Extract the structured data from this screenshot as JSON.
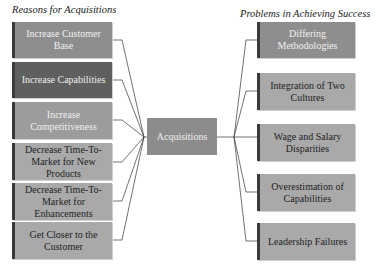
{
  "left_heading": "Reasons for Acquisitions",
  "right_heading": "Problems in Achieving Success",
  "center": {
    "label": "Acquisitions",
    "color": "#8c8c8c"
  },
  "reasons": [
    {
      "label": "Increase Customer Base",
      "color": "#8e8e8e"
    },
    {
      "label": "Increase Capabilities",
      "color": "#5f5f5f"
    },
    {
      "label": "Increase Competitiveness",
      "color": "#9c9c9c"
    },
    {
      "label": "Decrease Time-To-Market for New Products",
      "color": "#a9a9a9"
    },
    {
      "label": "Decrease Time-To-Market for Enhancements",
      "color": "#a9a9a9"
    },
    {
      "label": "Get Closer to the Customer",
      "color": "#a9a9a9"
    }
  ],
  "problems": [
    {
      "label": "Differing Methodologies",
      "color": "#8e8e8e"
    },
    {
      "label": "Integration of Two Cultures",
      "color": "#a9a9a9"
    },
    {
      "label": "Wage and Salary Disparities",
      "color": "#a9a9a9"
    },
    {
      "label": "Overestimation of Capabilities",
      "color": "#a9a9a9"
    },
    {
      "label": "Leadership Failures",
      "color": "#a9a9a9"
    }
  ]
}
